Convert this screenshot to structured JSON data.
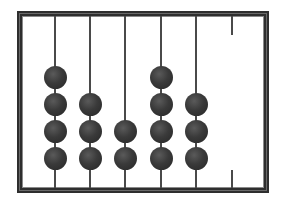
{
  "diagram": {
    "type": "abacus",
    "frame_color": "#2e2e2e",
    "rod_color": "#4a4a4a",
    "bead_color": "#3a3a3a",
    "rods": [
      {
        "index": 1,
        "beads": 4
      },
      {
        "index": 2,
        "beads": 3
      },
      {
        "index": 3,
        "beads": 2
      },
      {
        "index": 4,
        "beads": 4
      },
      {
        "index": 5,
        "beads": 3
      },
      {
        "index": 6,
        "beads": 0
      }
    ],
    "value": "432430"
  }
}
